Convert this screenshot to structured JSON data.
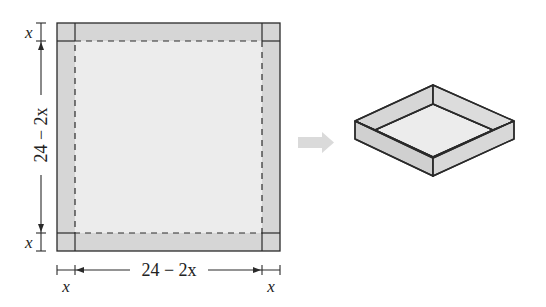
{
  "figure": {
    "colors": {
      "background": "#ffffff",
      "flap_fill": "#d6d6d6",
      "base_fill": "#ececec",
      "line": "#2a2a2a",
      "arrow": "#d9d9d9",
      "box_wall_fill": "#d3d3d3",
      "box_floor_fill": "#ececec"
    },
    "sheet": {
      "side_label_var": "x",
      "vertical_top_label": "x",
      "vertical_middle_label": "24 − 2x",
      "vertical_bottom_label": "x",
      "horizontal_left_label": "x",
      "horizontal_middle_label": "24 − 2x",
      "horizontal_right_label": "x"
    },
    "arrow": {
      "direction": "right"
    },
    "box": {
      "type": "open-top isometric box"
    }
  }
}
